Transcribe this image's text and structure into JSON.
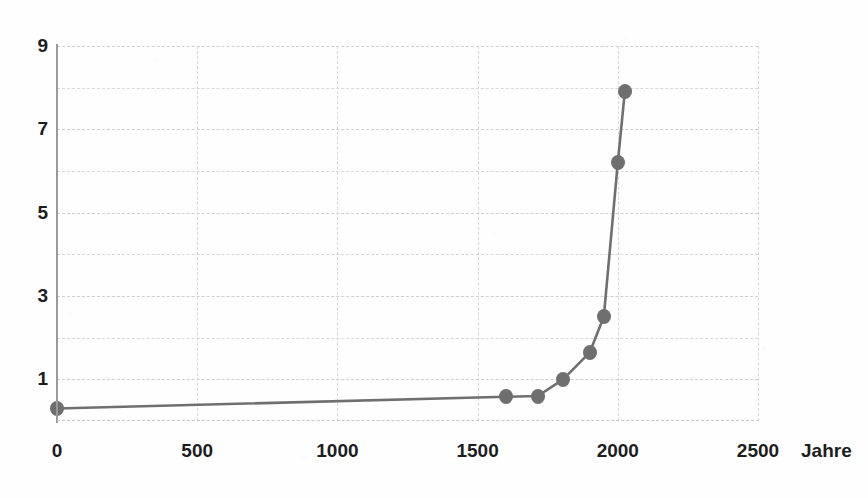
{
  "chart_data": {
    "type": "line",
    "title": "",
    "subtitle": "",
    "xlabel": "Jahre",
    "ylabel": "",
    "xlim": [
      0,
      2500
    ],
    "ylim": [
      0,
      9
    ],
    "grid": true,
    "legend": "none",
    "x_ticks": [
      0,
      500,
      1000,
      1500,
      2000,
      2500
    ],
    "x_tick_labels": [
      "0",
      "500",
      "1000",
      "1500",
      "2000",
      "2500"
    ],
    "y_ticks": [
      1,
      3,
      5,
      7,
      9
    ],
    "y_tick_labels": [
      "1",
      "3",
      "5",
      "7",
      "9"
    ],
    "y_minor_gridlines": [
      2,
      4,
      6,
      8
    ],
    "series": [
      {
        "name": "Weltbevölkerung",
        "color": "#6f6f6f",
        "marker": "circle",
        "x": [
          0,
          1600,
          1715,
          1805,
          1900,
          1950,
          2000,
          2025
        ],
        "values": [
          0.3,
          0.58,
          0.6,
          1.0,
          1.65,
          2.5,
          6.2,
          7.9
        ]
      }
    ]
  },
  "axis": {
    "line_color": "#9a9a9a",
    "grid_color": "#d8d8d8",
    "label_color": "#1d1d1d"
  },
  "x_tick_labels": [
    {
      "label": "0",
      "value": 0
    },
    {
      "label": "500",
      "value": 500
    },
    {
      "label": "1000",
      "value": 1000
    },
    {
      "label": "1500",
      "value": 1500
    },
    {
      "label": "2000",
      "value": 2000
    },
    {
      "label": "2500",
      "value": 2500
    }
  ],
  "y_tick_labels": [
    {
      "label": "9",
      "value": 9
    },
    {
      "label": "7",
      "value": 7
    },
    {
      "label": "5",
      "value": 5
    },
    {
      "label": "3",
      "value": 3
    },
    {
      "label": "1",
      "value": 1
    }
  ],
  "x_axis_title": "Jahre"
}
